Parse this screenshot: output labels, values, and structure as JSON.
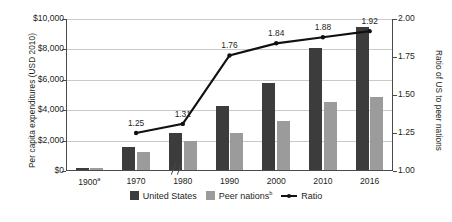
{
  "chart_data": {
    "type": "bar",
    "title": "",
    "categories": [
      "1900a",
      "1970",
      "1980",
      "1990",
      "2000",
      "2010",
      "2016"
    ],
    "category_labels": [
      "1900",
      "1970",
      "1980",
      "1990",
      "2000",
      "2010",
      "2016"
    ],
    "category_superscripts": [
      "a",
      "",
      "",
      "",
      "",
      "",
      ""
    ],
    "series": [
      {
        "name": "United States",
        "type": "bar",
        "axis": "left",
        "color": "#3c3c3c",
        "values": [
          150,
          1500,
          2450,
          4200,
          5750,
          8050,
          9400
        ]
      },
      {
        "name": "Peer nations",
        "name_superscript": "b",
        "type": "bar",
        "axis": "left",
        "color": "#9b9b9b",
        "values": [
          150,
          1200,
          1900,
          2450,
          3250,
          4450,
          4800
        ]
      },
      {
        "name": "Ratio",
        "type": "line",
        "axis": "right",
        "color": "#111111",
        "values": [
          null,
          1.25,
          1.31,
          1.76,
          1.84,
          1.88,
          1.92
        ],
        "point_labels": [
          "",
          "1.25",
          "1.31",
          "1.76",
          "1.84",
          "1.88",
          "1.92"
        ]
      }
    ],
    "xlabel": "",
    "ylabel": "Per capita expenditures (USD 2010)",
    "y2label": "Ratio of US to peer nations",
    "ylim": [
      0,
      10000
    ],
    "y2lim": [
      1.0,
      2.0
    ],
    "yticks": [
      0,
      2000,
      4000,
      6000,
      8000,
      10000
    ],
    "ytick_labels": [
      "$0",
      "$2,000",
      "$4,000",
      "$6,000",
      "$8,000",
      "$10,000"
    ],
    "y2ticks": [
      1.0,
      1.25,
      1.5,
      1.75,
      2.0
    ],
    "y2tick_labels": [
      "1.00",
      "1.25",
      "1.50",
      "1.75",
      "2.00"
    ],
    "grid": true,
    "legend_position": "bottom",
    "axis_break": true
  },
  "legend": {
    "items": [
      {
        "label": "United States",
        "superscript": "",
        "marker": "square-dark-swatch"
      },
      {
        "label": "Peer nations",
        "superscript": "b",
        "marker": "square-gray-swatch"
      },
      {
        "label": "Ratio",
        "superscript": "",
        "marker": "line-with-point-marker"
      }
    ]
  }
}
